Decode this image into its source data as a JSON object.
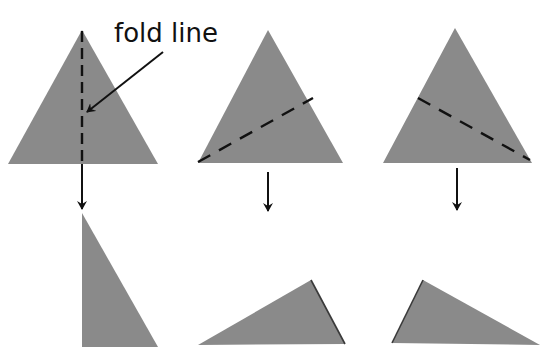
{
  "diagram": {
    "label": {
      "text": "fold line"
    },
    "colors": {
      "shape_fill": "#8a8a8a",
      "line": "#111111",
      "background": "#ffffff"
    },
    "panels": [
      {
        "id": "vertical-fold",
        "triangle": "82,30 8,164 158,164",
        "fold_line": {
          "x1": 82,
          "y1": 31,
          "x2": 82,
          "y2": 164
        },
        "arrow": {
          "x1": 82,
          "y1": 164,
          "x2": 82,
          "y2": 209
        },
        "result": "82,213 82,347 158,347"
      },
      {
        "id": "diagonal-fold-up-right",
        "triangle": "268,30 198,163 343,163",
        "fold_line": {
          "x1": 198,
          "y1": 162,
          "x2": 313,
          "y2": 98
        },
        "arrow": {
          "x1": 268,
          "y1": 172,
          "x2": 268,
          "y2": 211
        },
        "result": "198,345 311,280 345,344"
      },
      {
        "id": "diagonal-fold-down-right",
        "triangle": "455,28 383,163 532,163",
        "fold_line": {
          "x1": 418,
          "y1": 98,
          "x2": 530,
          "y2": 160
        },
        "arrow": {
          "x1": 457,
          "y1": 168,
          "x2": 457,
          "y2": 210
        },
        "result": "392,343 423,280 540,345"
      }
    ],
    "pointer_arrow": {
      "x1": 163,
      "y1": 52,
      "x2": 87,
      "y2": 112
    }
  }
}
